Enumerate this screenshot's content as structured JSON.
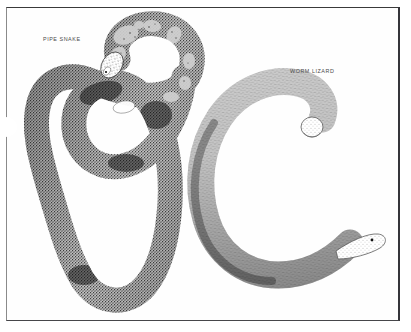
{
  "plate": {
    "kind": "natural-history-illustration",
    "medium": "stipple-and-line ink drawing",
    "background_color": "#ffffff",
    "ink_color": "#2b2b2b",
    "frame": {
      "present": true,
      "border_color_top": "#3a3a3a",
      "border_color_right": "#35353a",
      "border_color_bottom": "#46464a",
      "border_color_left": "#8a8a8a"
    },
    "figures": [
      {
        "id": "pipe-snake",
        "label": "PIPE SNAKE",
        "position": "left",
        "description": "Coiled snake looped over itself, blunt head raised at upper area, body knotted into a broad loop with a long U-shaped lower bend",
        "pattern": "dark stippled body with pale irregular blotches and bands toward the head",
        "tone": "dark",
        "label_position": {
          "x": 43,
          "y": 36
        }
      },
      {
        "id": "worm-lizard",
        "label": "WORM LIZARD",
        "position": "right",
        "description": "Thick limbless amphisbaenian curved into a large C or backwards-S, blunt rounded tail curled inward at top, narrow pointed head at lower right with a small dark eye",
        "pattern": "finely annulated rings of stipple, pale overall with shaded underside",
        "tone": "light",
        "label_position": {
          "x": 290,
          "y": 68
        }
      }
    ]
  },
  "labels": {
    "pipe_snake": "PIPE SNAKE",
    "worm_lizard": "WORM LIZARD"
  }
}
